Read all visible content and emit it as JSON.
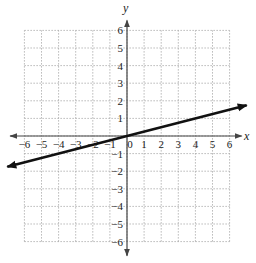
{
  "chart_data": {
    "type": "line",
    "title": "",
    "xlabel": "x",
    "ylabel": "y",
    "xlim": [
      -6,
      6
    ],
    "ylim": [
      -6,
      6
    ],
    "grid": true,
    "x_ticks": [
      -6,
      -5,
      -4,
      -3,
      -2,
      -1,
      0,
      1,
      2,
      3,
      4,
      5,
      6
    ],
    "y_ticks": [
      -6,
      -5,
      -4,
      -3,
      -2,
      -1,
      1,
      2,
      3,
      4,
      5,
      6
    ],
    "series": [
      {
        "name": "line",
        "equation": "y = x/4",
        "slope": 0.25,
        "intercept": 0,
        "x": [
          -7,
          0,
          7
        ],
        "y": [
          -1.75,
          0,
          1.75
        ],
        "arrows": "both"
      }
    ]
  },
  "axes": {
    "x_label": "x",
    "y_label": "y",
    "origin_label": "0"
  },
  "colors": {
    "axis": "#444444",
    "grid": "#999999",
    "line": "#111111"
  }
}
